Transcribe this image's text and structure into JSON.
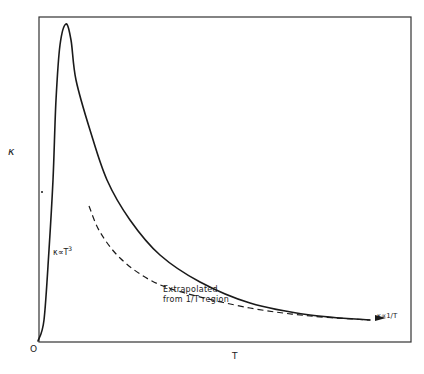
{
  "chart_data": {
    "type": "line",
    "title": "",
    "xlabel": "T",
    "ylabel": "κ",
    "origin_label": "O",
    "grid": false,
    "legend": null,
    "axis_ticks": "none (qualitative sketch)",
    "series": [
      {
        "name": "Measured thermal conductivity",
        "style": "solid",
        "points_px": [
          [
            38,
            341
          ],
          [
            44,
            320
          ],
          [
            49,
            250
          ],
          [
            53,
            180
          ],
          [
            56,
            100
          ],
          [
            60,
            45
          ],
          [
            66,
            24
          ],
          [
            71,
            40
          ],
          [
            76,
            80
          ],
          [
            90,
            130
          ],
          [
            107,
            180
          ],
          [
            130,
            220
          ],
          [
            160,
            255
          ],
          [
            200,
            282
          ],
          [
            250,
            303
          ],
          [
            310,
            315
          ],
          [
            370,
            320
          ]
        ]
      },
      {
        "name": "Extrapolated from 1/T region",
        "style": "dashed",
        "points_px": [
          [
            89,
            206
          ],
          [
            100,
            232
          ],
          [
            120,
            258
          ],
          [
            150,
            280
          ],
          [
            185,
            293
          ],
          [
            250,
            308
          ],
          [
            310,
            316
          ],
          [
            370,
            320
          ]
        ]
      }
    ],
    "annotations": [
      {
        "text": "κ∝T³",
        "near": "low-T rising branch"
      },
      {
        "text": "Extrapolated\nfrom 1/T region",
        "near": "dashed curve"
      },
      {
        "text": "κ∝1/T",
        "near": "high-T tail with arrow"
      }
    ]
  },
  "labels": {
    "y_axis": "κ",
    "x_axis": "T",
    "origin": "O",
    "t3_prefix": "κ∝T",
    "t3_exp": "3",
    "extrapolated_line1": "Extrapolated",
    "extrapolated_line2": "from 1/T region",
    "inverse": "κ∝1/T"
  },
  "colors": {
    "line": "#1a1a1a",
    "frame": "#333333",
    "background": "#ffffff"
  }
}
